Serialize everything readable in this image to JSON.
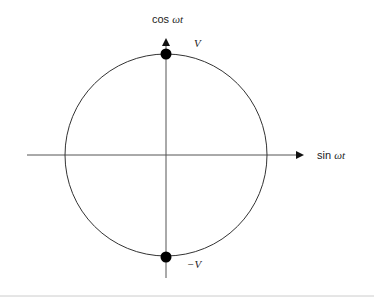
{
  "diagram": {
    "type": "phasor-circle",
    "x_axis": {
      "label_fn": "sin",
      "label_arg": "ωt"
    },
    "y_axis": {
      "label_fn": "cos",
      "label_arg": "ωt"
    },
    "circle": {
      "radius_label": "V"
    },
    "points": [
      {
        "id": "top",
        "label": "V",
        "angle_deg": 90
      },
      {
        "id": "bottom",
        "label": "−V",
        "angle_deg": 270
      }
    ],
    "colors": {
      "stroke": "#333333",
      "point": "#000000",
      "footer_rule": "#cccccc"
    }
  }
}
